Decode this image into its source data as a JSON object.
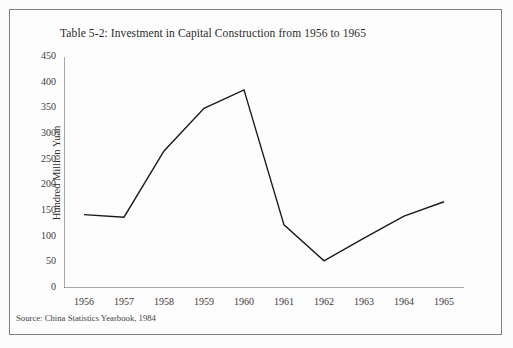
{
  "figure": {
    "title": "Table 5-2: Investment in Capital Construction from 1956 to 1965",
    "source_note": "Source: China Statistics Yearbook, 1984",
    "line_color": "#1a1a1a",
    "axis_color": "#555555",
    "background_color": "#fdfdfd",
    "frame_color": "#7b7f86"
  },
  "chart_data": {
    "type": "line",
    "title": "Table 5-2: Investment in Capital Construction from 1956 to 1965",
    "xlabel": "",
    "ylabel": "Hundred Million Yuan",
    "categories": [
      "1956",
      "1957",
      "1958",
      "1959",
      "1960",
      "1961",
      "1962",
      "1963",
      "1964",
      "1965"
    ],
    "values": [
      143,
      138,
      267,
      350,
      386,
      123,
      53,
      97,
      140,
      168
    ],
    "series": [
      {
        "name": "Investment in Capital Construction",
        "values": [
          143,
          138,
          267,
          350,
          386,
          123,
          53,
          97,
          140,
          168
        ]
      }
    ],
    "ylim": [
      0,
      450
    ],
    "y_ticks": [
      0,
      50,
      100,
      150,
      200,
      250,
      300,
      350,
      400,
      450
    ],
    "y_tick_labels": [
      "0",
      "50",
      "100",
      "150",
      "200",
      "250",
      "300",
      "350",
      "400",
      "450"
    ],
    "x_tick_labels": [
      "1956",
      "1957",
      "1958",
      "1959",
      "1960",
      "1961",
      "1962",
      "1963",
      "1964",
      "1965"
    ],
    "grid": false,
    "legend": "none",
    "legend_position": "none",
    "annotations": [
      "Source: China Statistics Yearbook, 1984"
    ]
  }
}
